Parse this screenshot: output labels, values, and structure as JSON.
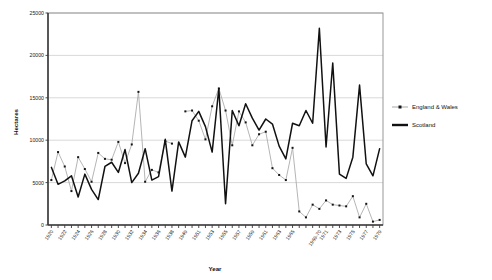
{
  "chart_data": {
    "type": "line",
    "title": "",
    "xlabel": "Year",
    "ylabel": "Hectares",
    "ylim": [
      0,
      25000
    ],
    "ytick_values": [
      0,
      5000,
      10000,
      15000,
      20000,
      25000
    ],
    "ytick_labels": [
      "0",
      "5000",
      "10000",
      "15000",
      "20000",
      "25000"
    ],
    "grid": "horizontal",
    "legend_position": "right",
    "xtick_labels": [
      "1920",
      "1922",
      "1924",
      "1926",
      "1928",
      "1930",
      "1932",
      "1934",
      "1936",
      "1938",
      "1949",
      "1951",
      "1953",
      "1955",
      "1957",
      "1959",
      "1961",
      "1963",
      "1965",
      "1969-70",
      "1971",
      "1973",
      "1975",
      "1977",
      "1979"
    ],
    "x_categories": [
      "1920",
      "1921",
      "1922",
      "1923",
      "1924",
      "1925",
      "1926",
      "1927",
      "1928",
      "1929",
      "1930",
      "1931",
      "1932",
      "1933",
      "1934",
      "1935",
      "1936",
      "1937",
      "1938",
      "1939",
      "1949",
      "1950",
      "1951",
      "1952",
      "1953",
      "1954",
      "1955",
      "1956",
      "1957",
      "1958",
      "1959",
      "1960",
      "1961",
      "1962",
      "1963",
      "1964",
      "1965",
      "1966",
      "1967",
      "1968",
      "1969-70",
      "1971",
      "1972",
      "1973",
      "1974",
      "1975",
      "1976",
      "1977",
      "1978",
      "1979"
    ],
    "series": [
      {
        "name": "England & Wales",
        "color": "#a8a8a8",
        "marker": "square",
        "values": [
          5300,
          8600,
          6900,
          4000,
          8000,
          6600,
          5100,
          8500,
          7800,
          7700,
          9800,
          7300,
          9500,
          15700,
          5100,
          6500,
          6200,
          9900,
          9600,
          null,
          13400,
          13500,
          12300,
          10100,
          14000,
          16100,
          13500,
          9400,
          13400,
          12100,
          9400,
          10700,
          11000,
          6700,
          5900,
          5300,
          9100,
          1600,
          900,
          2400,
          1900,
          2900,
          2400,
          2300,
          2200,
          3400,
          900,
          2500,
          400,
          600
        ]
      },
      {
        "name": "Scotland",
        "color": "#111111",
        "marker": "none",
        "values": [
          6800,
          4800,
          5200,
          5800,
          3300,
          6000,
          4200,
          3000,
          6900,
          7400,
          6200,
          8900,
          5000,
          6100,
          9000,
          5300,
          5700,
          10100,
          4000,
          9800,
          8000,
          12300,
          13400,
          11600,
          8600,
          16100,
          2500,
          13500,
          11700,
          14300,
          12600,
          11200,
          12500,
          11900,
          9300,
          7800,
          12000,
          11700,
          13500,
          12000,
          23200,
          9200,
          19100,
          6000,
          5500,
          8000,
          16500,
          7200,
          5800,
          9000
        ]
      }
    ]
  },
  "legend": {
    "items": [
      {
        "label": "England & Wales",
        "type": "line-marker"
      },
      {
        "label": "Scotland",
        "type": "line-thick"
      }
    ]
  }
}
